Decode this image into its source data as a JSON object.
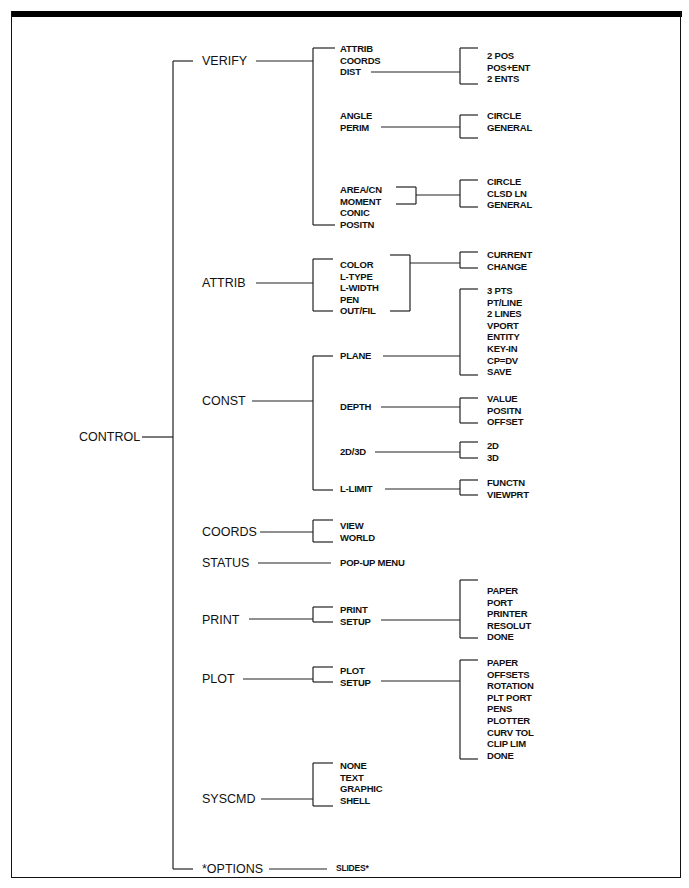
{
  "diagram": {
    "root": "CONTROL",
    "branches": [
      {
        "label": "VERIFY",
        "children": [
          {
            "items": [
              "ATTRIB",
              "COORDS",
              "DIST"
            ],
            "leads_from": "DIST",
            "options": [
              "2 POS",
              "POS+ENT",
              "2 ENTS"
            ]
          },
          {
            "items": [
              "ANGLE",
              "PERIM"
            ],
            "options": [
              "CIRCLE",
              "GENERAL"
            ]
          },
          {
            "items": [
              "AREA/CN",
              "MOMENT"
            ],
            "options": [
              "CIRCLE",
              "CLSD LN",
              "GENERAL"
            ]
          },
          {
            "items": [
              "CONIC",
              "POSITN"
            ],
            "options": []
          }
        ]
      },
      {
        "label": "ATTRIB",
        "children": [
          {
            "items": [
              "COLOR",
              "L-TYPE",
              "L-WIDTH",
              "PEN",
              "OUT/FIL"
            ],
            "options": [
              "CURRENT",
              "CHANGE"
            ]
          }
        ]
      },
      {
        "label": "CONST",
        "children": [
          {
            "items": [
              "PLANE"
            ],
            "options": [
              "3 PTS",
              "PT/LINE",
              "2 LINES",
              "VPORT",
              "ENTITY",
              "KEY-IN",
              "CP=DV",
              "SAVE"
            ]
          },
          {
            "items": [
              "DEPTH"
            ],
            "options": [
              "VALUE",
              "POSITN",
              "OFFSET"
            ]
          },
          {
            "items": [
              "2D/3D"
            ],
            "options": [
              "2D",
              "3D"
            ]
          },
          {
            "items": [
              "L-LIMIT"
            ],
            "options": [
              "FUNCTN",
              "VIEWPRT"
            ]
          }
        ]
      },
      {
        "label": "COORDS",
        "children": [
          {
            "items": [
              "VIEW",
              "WORLD"
            ],
            "options": []
          }
        ]
      },
      {
        "label": "STATUS",
        "children": [
          {
            "items": [
              "POP-UP MENU"
            ],
            "options": []
          }
        ]
      },
      {
        "label": "PRINT",
        "children": [
          {
            "items": [
              "PRINT",
              "SETUP"
            ],
            "leads_from": "SETUP",
            "options": [
              "PAPER",
              "PORT",
              "PRINTER",
              "RESOLUT",
              "DONE"
            ]
          }
        ]
      },
      {
        "label": "PLOT",
        "children": [
          {
            "items": [
              "PLOT",
              "SETUP"
            ],
            "leads_from": "SETUP",
            "options": [
              "PAPER",
              "OFFSETS",
              "ROTATION",
              "PLT PORT",
              "PENS",
              "PLOTTER",
              "CURV TOL",
              "CLIP LIM",
              "DONE"
            ]
          }
        ]
      },
      {
        "label": "SYSCMD",
        "children": [
          {
            "items": [
              "NONE",
              "TEXT",
              "GRAPHIC",
              "SHELL"
            ],
            "options": []
          }
        ]
      },
      {
        "label": "*OPTIONS",
        "children": [
          {
            "items": [
              "SLIDES*"
            ],
            "options": []
          }
        ]
      }
    ]
  }
}
